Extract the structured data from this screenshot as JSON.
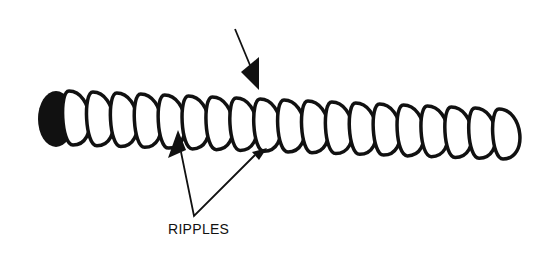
{
  "figure": {
    "labels": {
      "ripples": "RIPPLES"
    },
    "colors": {
      "ink": "#111111",
      "background": "#ffffff"
    },
    "ring_count": 19
  }
}
